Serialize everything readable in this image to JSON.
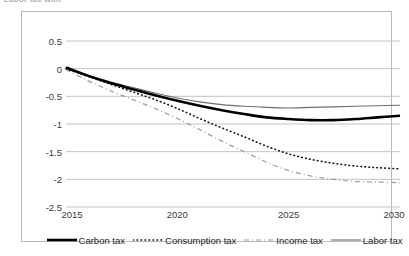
{
  "caption": {
    "text": "Labor tax with"
  },
  "chart_data": {
    "type": "line",
    "title": "",
    "subtitle": "",
    "xlabel": "",
    "ylabel": "",
    "xlim": [
      2015,
      2030
    ],
    "ylim": [
      -2.5,
      0.5
    ],
    "grid": true,
    "grid_axis": "y",
    "legend_position": "bottom",
    "x_ticks": [
      "2015",
      "2020",
      "2025",
      "2030"
    ],
    "x_tick_values": [
      2015,
      2020,
      2025,
      2030
    ],
    "y_ticks": [
      "0.5",
      "0",
      "-0.5",
      "-1",
      "-1.5",
      "-2",
      "-2.5"
    ],
    "y_tick_values": [
      0.5,
      0,
      -0.5,
      -1,
      -1.5,
      -2,
      -2.5
    ],
    "x": [
      2015,
      2016,
      2017,
      2018,
      2019,
      2020,
      2021,
      2022,
      2023,
      2024,
      2025,
      2026,
      2027,
      2028,
      2029,
      2030
    ],
    "series": [
      {
        "name": "Carbon tax",
        "style": "solid-thick",
        "color": "#000000",
        "width": 2.6,
        "values": [
          0.02,
          -0.13,
          -0.26,
          -0.37,
          -0.48,
          -0.58,
          -0.67,
          -0.75,
          -0.82,
          -0.88,
          -0.91,
          -0.93,
          -0.93,
          -0.91,
          -0.88,
          -0.85
        ]
      },
      {
        "name": "Consumption tax",
        "style": "dotted",
        "color": "#101010",
        "width": 1.6,
        "values": [
          0.0,
          -0.14,
          -0.28,
          -0.42,
          -0.56,
          -0.72,
          -0.9,
          -1.07,
          -1.23,
          -1.4,
          -1.54,
          -1.64,
          -1.71,
          -1.76,
          -1.79,
          -1.81
        ]
      },
      {
        "name": "Income tax",
        "style": "dashed",
        "color": "#9a9a9a",
        "width": 1.2,
        "values": [
          -0.02,
          -0.22,
          -0.4,
          -0.56,
          -0.72,
          -0.9,
          -1.1,
          -1.31,
          -1.5,
          -1.69,
          -1.84,
          -1.94,
          -2.0,
          -2.04,
          -2.05,
          -2.06
        ]
      },
      {
        "name": "Labor tax",
        "style": "solid-thin",
        "color": "#6e6e6e",
        "width": 1.1,
        "values": [
          0.0,
          -0.12,
          -0.24,
          -0.34,
          -0.44,
          -0.53,
          -0.6,
          -0.65,
          -0.68,
          -0.7,
          -0.71,
          -0.7,
          -0.69,
          -0.68,
          -0.67,
          -0.66
        ]
      }
    ]
  }
}
